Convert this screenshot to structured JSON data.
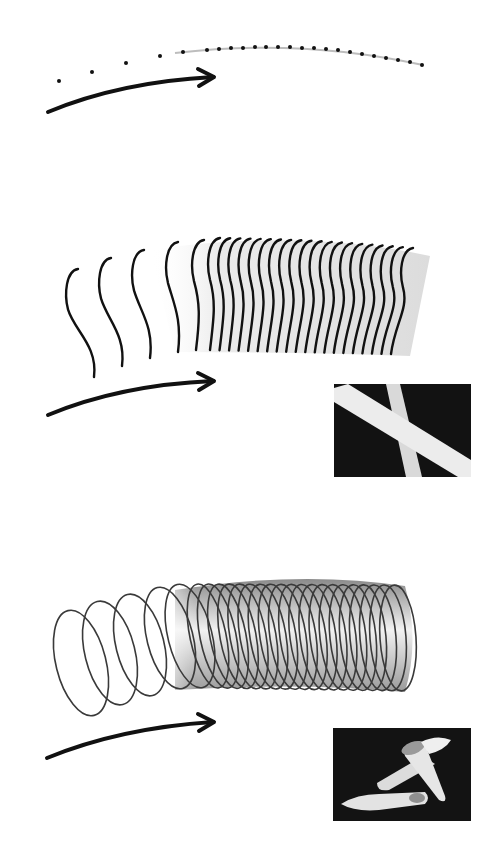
{
  "canvas": {
    "width": 501,
    "height": 845,
    "background": "#ffffff"
  },
  "colors": {
    "ink": "#111111",
    "ring_stroke": "#3a3a3a",
    "guide_line": "#bdbdbd",
    "photo_bg": "#141414",
    "photo_tube": "#e9e9e9"
  },
  "panels": [
    {
      "id": "points",
      "description": "Sequence of dots along a curved path",
      "sparse_dots": [
        [
          59,
          81
        ],
        [
          92,
          72
        ],
        [
          126,
          63
        ],
        [
          160,
          56
        ]
      ],
      "guide_path": "M175,53 Q300,38 423,65",
      "dense_dots": [
        [
          183,
          52
        ],
        [
          207,
          50
        ],
        [
          219,
          49
        ],
        [
          231,
          48
        ],
        [
          243,
          48
        ],
        [
          255,
          47
        ],
        [
          266,
          47
        ],
        [
          278,
          47
        ],
        [
          290,
          47
        ],
        [
          302,
          48
        ],
        [
          314,
          48
        ],
        [
          326,
          49
        ],
        [
          338,
          50
        ],
        [
          350,
          52
        ],
        [
          362,
          54
        ],
        [
          374,
          56
        ],
        [
          386,
          58
        ],
        [
          398,
          60
        ],
        [
          410,
          62
        ],
        [
          422,
          65
        ]
      ],
      "arrow": {
        "path": "M48,112 Q120,82 213,77",
        "head": "M198,69 L214,77 L199,86"
      }
    },
    {
      "id": "curves",
      "description": "Sequence of S-shaped cross-section curves forming a sheet",
      "sparse_curves": [
        {
          "top": [
            70,
            273
          ],
          "bottom": [
            92,
            377
          ]
        },
        {
          "top": [
            103,
            262
          ],
          "bottom": [
            120,
            366
          ]
        },
        {
          "top": [
            136,
            254
          ],
          "bottom": [
            148,
            358
          ]
        },
        {
          "top": [
            170,
            246
          ],
          "bottom": [
            176,
            352
          ]
        },
        {
          "top": [
            196,
            244
          ],
          "bottom": [
            194,
            350
          ]
        }
      ],
      "dense_start_x": 212,
      "dense_end_x": 435,
      "dense_count": 20,
      "arrow": {
        "path": "M48,415 Q120,385 213,381",
        "head": "M198,373 L214,381 L199,390"
      },
      "photo": {
        "x": 334,
        "y": 384,
        "w": 137,
        "h": 93,
        "subject": "two crossing straight tubes"
      }
    },
    {
      "id": "rings",
      "description": "Sequence of elliptical rings sweeping into a tube",
      "sparse_rings": [
        {
          "cx": 81,
          "cy": 663,
          "rx": 25,
          "ry": 54
        },
        {
          "cx": 110,
          "cy": 653,
          "rx": 25,
          "ry": 53
        },
        {
          "cx": 140,
          "cy": 645,
          "rx": 24,
          "ry": 52
        },
        {
          "cx": 170,
          "cy": 638,
          "rx": 23,
          "ry": 52
        },
        {
          "cx": 190,
          "cy": 636,
          "rx": 22,
          "ry": 53
        }
      ],
      "dense_start_x": 208,
      "dense_end_x": 398,
      "dense_count": 20,
      "arrow": {
        "path": "M47,758 Q120,728 213,722",
        "head": "M198,714 L214,722 L199,731"
      },
      "photo": {
        "x": 333,
        "y": 728,
        "w": 138,
        "h": 93,
        "subject": "penne pasta tubes"
      }
    }
  ]
}
